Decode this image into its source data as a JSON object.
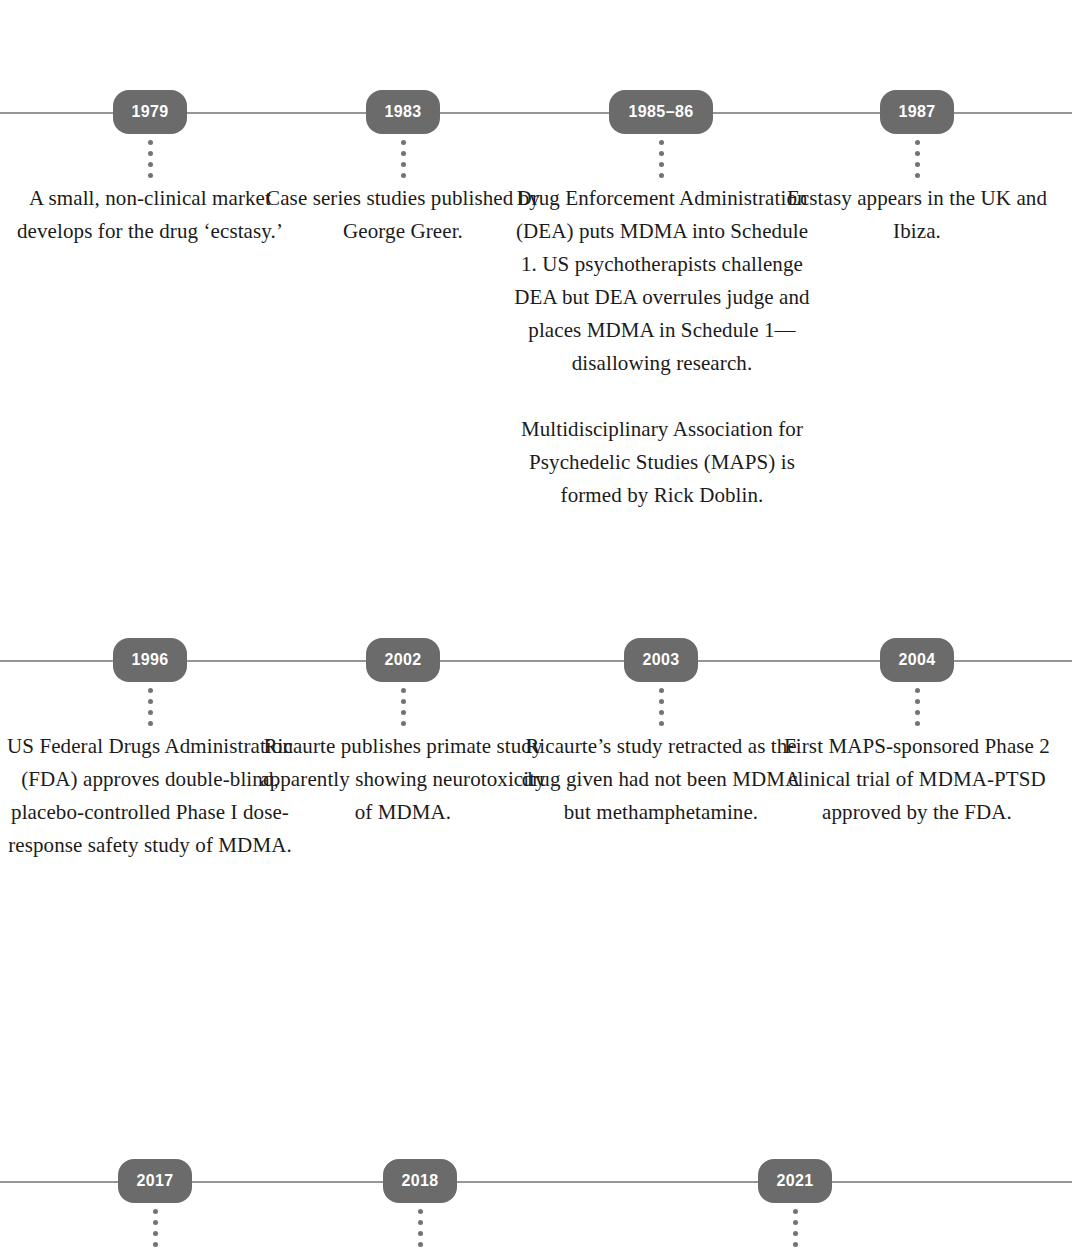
{
  "document": {
    "type": "historical-timeline",
    "subject": "MDMA research history",
    "background_color": "#ffffff",
    "pill_color": "#6b6b6b",
    "pill_text_color": "#ffffff",
    "line_color": "#8d8d8d",
    "body_text_color": "#1b1b1b"
  },
  "rows": [
    {
      "id": "row-1",
      "entries": [
        {
          "year": "1979",
          "paragraphs": [
            "A small, non-clinical market develops for the drug ‘ecstasy.’"
          ]
        },
        {
          "year": "1983",
          "paragraphs": [
            "Case series studies published by George Greer."
          ]
        },
        {
          "year": "1985–86",
          "paragraphs": [
            "Drug Enforcement Administration (DEA) puts MDMA into Schedule 1. US psychotherapists challenge DEA but DEA overrules judge and places MDMA in Schedule 1—disallowing research.",
            "Multidisciplinary Association for Psychedelic Studies (MAPS) is formed by Rick Doblin."
          ]
        },
        {
          "year": "1987",
          "paragraphs": [
            "Ecstasy appears in the UK and Ibiza."
          ]
        }
      ]
    },
    {
      "id": "row-2",
      "entries": [
        {
          "year": "1996",
          "paragraphs": [
            "US Federal Drugs Administration (FDA) approves double-blind, placebo-controlled Phase I dose-response safety study of MDMA."
          ]
        },
        {
          "year": "2002",
          "paragraphs": [
            "Ricaurte publishes primate study apparently showing neurotoxicity of MDMA."
          ]
        },
        {
          "year": "2003",
          "paragraphs": [
            "Ricaurte’s study retracted as the drug given had not been MDMA but methamphetamine."
          ]
        },
        {
          "year": "2004",
          "paragraphs": [
            "First MAPS-sponsored Phase 2 clinical trial of MDMA-PTSD approved by the FDA."
          ]
        }
      ]
    },
    {
      "id": "row-3",
      "entries": [
        {
          "year": "2017",
          "paragraphs": []
        },
        {
          "year": "2018",
          "paragraphs": []
        },
        {
          "year": "2021",
          "paragraphs": []
        }
      ]
    }
  ]
}
